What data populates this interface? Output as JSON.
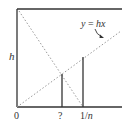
{
  "diagram": {
    "labels": {
      "h": "h",
      "origin": "0",
      "unknown": "?",
      "one_over_n": "1/",
      "n": "n",
      "line_eq_y": "y",
      "line_eq_rest": " = ",
      "line_eq_hx": "hx"
    },
    "colors": {
      "frame": "#333333",
      "dotted": "#999999",
      "bar": "#333333"
    }
  }
}
